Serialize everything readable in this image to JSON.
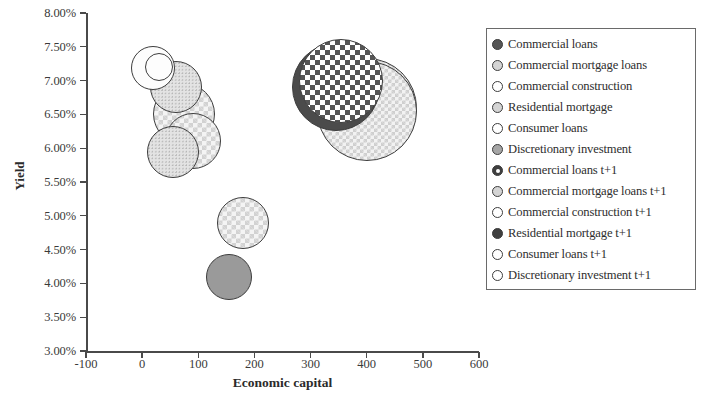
{
  "chart_data": {
    "type": "scatter",
    "title": "",
    "xlabel": "Economic capital",
    "ylabel": "Yield",
    "xlim": [
      -100,
      600
    ],
    "ylim": [
      0.03,
      0.08
    ],
    "xticks": [
      "-100",
      "0",
      "100",
      "200",
      "300",
      "400",
      "500",
      "600"
    ],
    "yticks": [
      "3.00%",
      "3.50%",
      "4.00%",
      "4.50%",
      "5.00%",
      "5.50%",
      "6.00%",
      "6.50%",
      "7.00%",
      "7.50%",
      "8.00%"
    ],
    "grid": false,
    "legend_position": "right",
    "note": "Bubble chart: x = economic capital, y = yield, bubble area = relative size",
    "points": [
      {
        "name": "Commercial loans",
        "x": 30,
        "y": 0.072,
        "r": 14,
        "fill": "fill-white",
        "marker": "m-dark"
      },
      {
        "name": "Commercial mortgage loans",
        "x": 20,
        "y": 0.0718,
        "r": 22,
        "fill": "fill-white",
        "marker": "m-lightgray"
      },
      {
        "name": "Commercial construction",
        "x": 60,
        "y": 0.069,
        "r": 26,
        "fill": "fill-stipple",
        "marker": "m-white"
      },
      {
        "name": "Residential mortgage",
        "x": 75,
        "y": 0.065,
        "r": 31,
        "fill": "fill-diamond",
        "marker": "m-lightgray"
      },
      {
        "name": "Consumer loans",
        "x": 55,
        "y": 0.0595,
        "r": 26,
        "fill": "fill-stipple",
        "marker": "m-white"
      },
      {
        "name": "Discretionary investment",
        "x": 155,
        "y": 0.041,
        "r": 23,
        "fill": "fill-midgray",
        "marker": "m-midgray"
      },
      {
        "name": "Commercial loans t+1",
        "x": 355,
        "y": 0.07,
        "r": 42,
        "fill": "fill-checker",
        "marker": "m-checker"
      },
      {
        "name": "Commercial mortgage loans t+1",
        "x": 345,
        "y": 0.069,
        "r": 44,
        "fill": "fill-dark",
        "marker": "m-lightgray"
      },
      {
        "name": "Commercial construction t+1",
        "x": 400,
        "y": 0.066,
        "r": 50,
        "fill": "fill-diamond-fine",
        "marker": "m-white"
      },
      {
        "name": "Residential mortgage t+1",
        "x": 90,
        "y": 0.061,
        "r": 28,
        "fill": "fill-diamond",
        "marker": "m-verydark"
      },
      {
        "name": "Consumer loans t+1",
        "x": 180,
        "y": 0.049,
        "r": 26,
        "fill": "fill-diamond",
        "marker": "m-white"
      },
      {
        "name": "Discretionary investment t+1",
        "x": 400,
        "y": 0.0655,
        "r": 50,
        "fill": "fill-diamond-fine",
        "marker": "m-white"
      }
    ]
  },
  "legend": {
    "items": [
      {
        "label": "Commercial loans",
        "marker": "m-dark",
        "dot": false
      },
      {
        "label": "Commercial mortgage loans",
        "marker": "m-lightgray",
        "dot": false
      },
      {
        "label": "Commercial construction",
        "marker": "m-white",
        "dot": false
      },
      {
        "label": "Residential mortgage",
        "marker": "m-lightgray",
        "dot": false
      },
      {
        "label": "Consumer loans",
        "marker": "m-white",
        "dot": false
      },
      {
        "label": "Discretionary investment",
        "marker": "m-midgray",
        "dot": false
      },
      {
        "label": "Commercial loans t+1",
        "marker": "m-verydark",
        "dot": true
      },
      {
        "label": "Commercial mortgage loans t+1",
        "marker": "m-lightgray",
        "dot": false
      },
      {
        "label": "Commercial construction t+1",
        "marker": "m-white",
        "dot": false
      },
      {
        "label": "Residential mortgage t+1",
        "marker": "m-verydark",
        "dot": false
      },
      {
        "label": "Consumer loans t+1",
        "marker": "m-white",
        "dot": false
      },
      {
        "label": "Discretionary investment t+1",
        "marker": "m-white",
        "dot": false
      }
    ]
  }
}
